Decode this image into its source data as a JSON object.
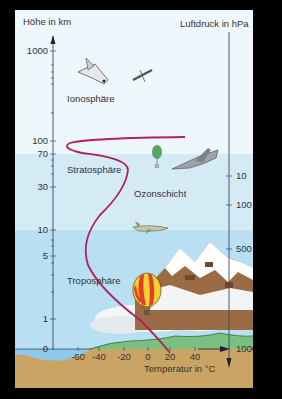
{
  "axes": {
    "left_title": "Höhe in km",
    "right_title": "Luftdruck in hPa",
    "bottom_title": "Temperatur in °C",
    "left_ticks": [
      {
        "label": "1000",
        "y": 51
      },
      {
        "label": "100",
        "y": 141
      },
      {
        "label": "70",
        "y": 154
      },
      {
        "label": "30",
        "y": 187
      },
      {
        "label": "10",
        "y": 230
      },
      {
        "label": "5",
        "y": 256
      },
      {
        "label": "1",
        "y": 319
      },
      {
        "label": "0",
        "y": 349
      }
    ],
    "right_ticks": [
      {
        "label": "10",
        "y": 176
      },
      {
        "label": "100",
        "y": 205
      },
      {
        "label": "500",
        "y": 249
      },
      {
        "label": "1000",
        "y": 349
      }
    ],
    "bottom_ticks": [
      {
        "label": "-60",
        "x": 78
      },
      {
        "label": "-40",
        "x": 99
      },
      {
        "label": "-20",
        "x": 124
      },
      {
        "label": "0",
        "x": 148
      },
      {
        "label": "20",
        "x": 170
      },
      {
        "label": "40",
        "x": 195
      }
    ]
  },
  "layers": {
    "ionosphere": "Ionosphäre",
    "stratosphere": "Stratosphäre",
    "ozone": "Ozonschicht",
    "troposphere": "Troposphäre"
  },
  "colors": {
    "frame": "#000000",
    "space": "#eef7fb",
    "stratosphere": "#d3eaf5",
    "troposphere": "#b7def3",
    "ground": "#c9a464",
    "grass": "#7cc07f",
    "water": "#8ec9ec",
    "curve": "#b0245a",
    "axis": "#3a4a66"
  },
  "icons": [
    "space-shuttle-icon",
    "satellite-icon",
    "weather-balloon-icon",
    "fighter-jet-icon",
    "airliner-icon",
    "hot-air-balloon-icon",
    "mountain-icon",
    "cloud-icon"
  ]
}
